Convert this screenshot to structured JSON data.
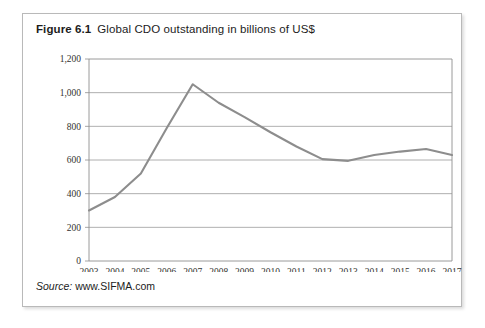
{
  "figure": {
    "number": "Figure 6.1",
    "title": "Global CDO outstanding in billions of US$",
    "source_label": "Source:",
    "source_url": "www.SIFMA.com"
  },
  "chart_data": {
    "type": "line",
    "title": "Global CDO outstanding in billions of US$",
    "xlabel": "",
    "ylabel": "",
    "categories": [
      "2003",
      "2004",
      "2005",
      "2006",
      "2007",
      "2008",
      "2009",
      "2010",
      "2011",
      "2012",
      "2013",
      "2014",
      "2015",
      "2016",
      "2017"
    ],
    "values": [
      300,
      380,
      520,
      790,
      1050,
      940,
      855,
      765,
      680,
      605,
      595,
      630,
      650,
      665,
      630
    ],
    "ylim": [
      0,
      1200
    ],
    "yticks": [
      0,
      200,
      400,
      600,
      800,
      1000,
      1200
    ],
    "ytick_labels": [
      "0",
      "200",
      "400",
      "600",
      "800",
      "1,000",
      "1,200"
    ],
    "grid": true,
    "grid_axis": "y",
    "legend": false,
    "line_color": "#8d8d8d",
    "grid_color": "#9a9a9a",
    "axis_color": "#8e8e8e"
  }
}
